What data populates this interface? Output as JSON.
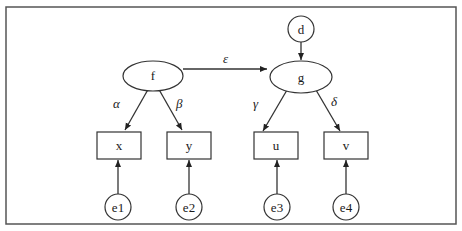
{
  "diagram": {
    "type": "structural-equation-model",
    "latent_nodes": [
      {
        "id": "f",
        "label": "f"
      },
      {
        "id": "g",
        "label": "g"
      }
    ],
    "disturbance_nodes": [
      {
        "id": "d",
        "label": "d"
      }
    ],
    "observed_nodes": [
      {
        "id": "x",
        "label": "x"
      },
      {
        "id": "y",
        "label": "y"
      },
      {
        "id": "u",
        "label": "u"
      },
      {
        "id": "v",
        "label": "v"
      }
    ],
    "error_nodes": [
      {
        "id": "e1",
        "label": "e1"
      },
      {
        "id": "e2",
        "label": "e2"
      },
      {
        "id": "e3",
        "label": "e3"
      },
      {
        "id": "e4",
        "label": "e4"
      }
    ],
    "paths": [
      {
        "from": "f",
        "to": "x",
        "label": "α"
      },
      {
        "from": "f",
        "to": "y",
        "label": "β"
      },
      {
        "from": "f",
        "to": "g",
        "label": "ε"
      },
      {
        "from": "g",
        "to": "u",
        "label": "γ"
      },
      {
        "from": "g",
        "to": "v",
        "label": "δ"
      },
      {
        "from": "d",
        "to": "g",
        "label": ""
      },
      {
        "from": "e1",
        "to": "x",
        "label": ""
      },
      {
        "from": "e2",
        "to": "y",
        "label": ""
      },
      {
        "from": "e3",
        "to": "u",
        "label": ""
      },
      {
        "from": "e4",
        "to": "v",
        "label": ""
      }
    ]
  },
  "labels": {
    "f": "f",
    "g": "g",
    "d": "d",
    "x": "x",
    "y": "y",
    "u": "u",
    "v": "v",
    "e1": "e1",
    "e2": "e2",
    "e3": "e3",
    "e4": "e4",
    "alpha": "α",
    "beta": "β",
    "epsilon": "ε",
    "gamma": "γ",
    "delta": "δ"
  },
  "colors": {
    "stroke": "#333333",
    "frame": "#555555",
    "background": "#ffffff"
  }
}
